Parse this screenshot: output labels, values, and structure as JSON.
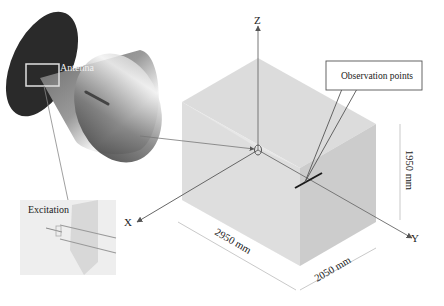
{
  "diagram": {
    "labels": {
      "antenna": "Antenna",
      "excitation": "Excitation",
      "observation_points": "Observation points",
      "axis_x": "X",
      "axis_y": "Y",
      "axis_z": "Z"
    },
    "dimensions": {
      "length": "2950 mm",
      "width": "2050 mm",
      "height": "1950 mm"
    },
    "colors": {
      "antenna_disk": "#2a2a2a",
      "box_top": "#d8d8d8",
      "box_left": "#e2e2e2",
      "box_right": "#c4c4c4",
      "observation_line": "#1a1a1a"
    }
  }
}
